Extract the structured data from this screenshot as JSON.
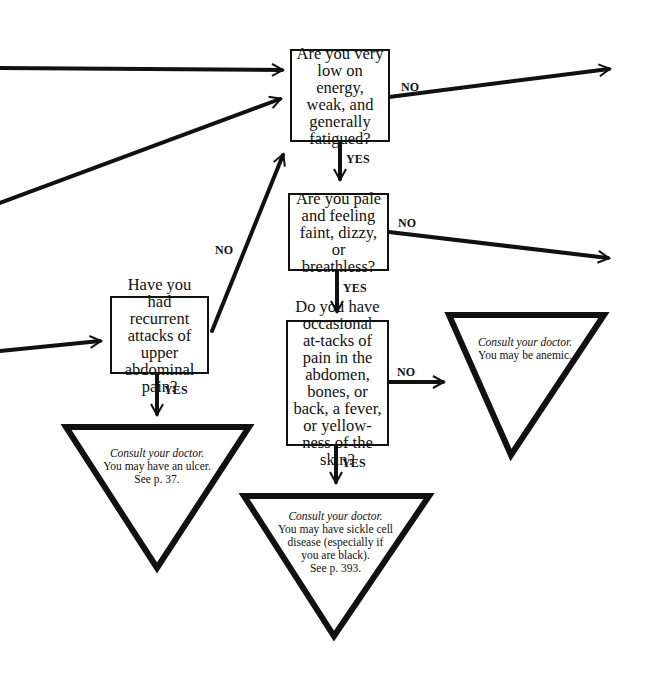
{
  "questions": {
    "energy": {
      "text": "Are you very low on energy, weak, and generally fatigued?"
    },
    "pale": {
      "text": "Are you pale and feeling faint, dizzy, or breathless?"
    },
    "sickle": {
      "text": "Do you have occasional at-tacks of pain in the abdomen, bones, or back, a fever, or yellow-ness of the skin?"
    },
    "abdominal": {
      "text": "Have you had recurrent attacks of upper abdominal pain?"
    }
  },
  "labels": {
    "yes": "YES",
    "no": "NO"
  },
  "outcomes": {
    "anemic": {
      "title": "Consult your doctor.",
      "lines": [
        "You may be anemic."
      ]
    },
    "ulcer": {
      "title": "Consult your doctor.",
      "lines": [
        "You may have an ulcer.",
        "See p. 37."
      ]
    },
    "sickle": {
      "title": "Consult your doctor.",
      "lines": [
        "You may have sickle cell",
        "disease (especially if",
        "you are black).",
        "See p. 393."
      ]
    }
  }
}
